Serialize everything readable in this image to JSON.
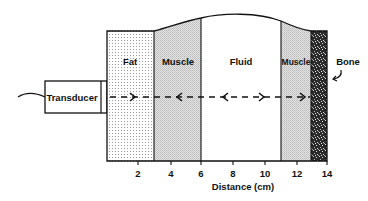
{
  "diagram": {
    "transducer_label": "Transducer",
    "layers": [
      {
        "name": "fat",
        "label": "Fat",
        "from_cm": 0,
        "to_cm": 3
      },
      {
        "name": "muscle-1",
        "label": "Muscle",
        "from_cm": 3,
        "to_cm": 6
      },
      {
        "name": "fluid",
        "label": "Fluid",
        "from_cm": 6,
        "to_cm": 11
      },
      {
        "name": "muscle-2",
        "label": "Muscle",
        "from_cm": 11,
        "to_cm": 13
      },
      {
        "name": "bone",
        "label": "Bone",
        "from_cm": 13,
        "to_cm": 14
      }
    ],
    "axis": {
      "label": "Distance (cm)",
      "ticks": [
        "2",
        "4",
        "6",
        "8",
        "10",
        "12",
        "14"
      ]
    },
    "colors": {
      "line": "#111111",
      "fat_dots": "#9a9a9a",
      "muscle_fill": "#d6d6d6",
      "bone_fill": "#2a2a2a",
      "background": "#ffffff"
    }
  }
}
